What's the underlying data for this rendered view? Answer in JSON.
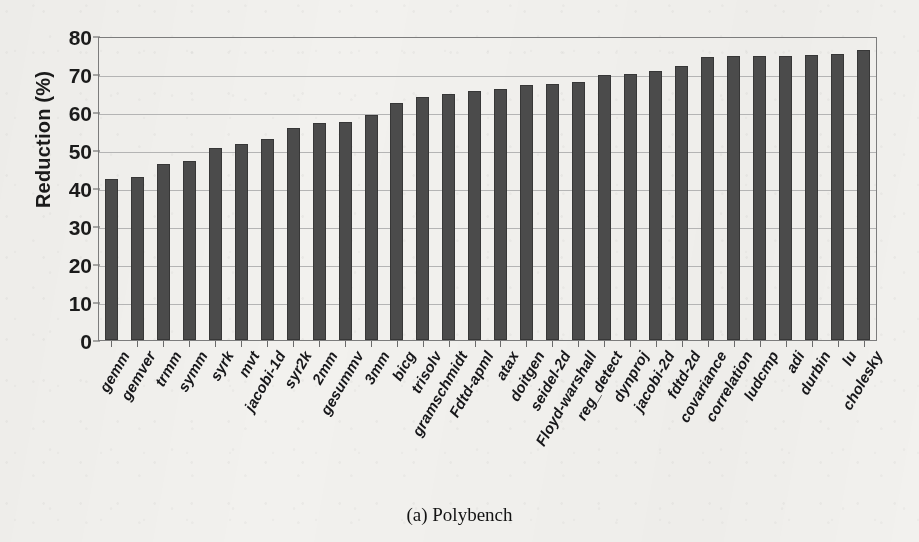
{
  "figure": {
    "caption": "(a) Polybench"
  },
  "chart_data": {
    "type": "bar",
    "title": "",
    "subtitle": "",
    "xlabel": "",
    "ylabel": "Reduction (%)",
    "ylim": [
      0,
      80
    ],
    "ytick_values": [
      0,
      10,
      20,
      30,
      40,
      50,
      60,
      70,
      80
    ],
    "ytick_labels": [
      "0",
      "10",
      "20",
      "30",
      "40",
      "50",
      "60",
      "70",
      "80"
    ],
    "grid": "horizontal",
    "legend": "none",
    "bar_color": "#4b4b4b",
    "background_color": "#f2f1ee",
    "categories": [
      "gemm",
      "gemver",
      "trmm",
      "symm",
      "syrk",
      "mvt",
      "jacobi-1d",
      "syr2k",
      "2mm",
      "gesummv",
      "3mm",
      "bicg",
      "trisolv",
      "gramschmidt",
      "Fdtd-apml",
      "atax",
      "doitgen",
      "seidel-2d",
      "Floyd-warshall",
      "reg_detect",
      "dynproj",
      "jacobi-2d",
      "fdtd-2d",
      "covariance",
      "correlation",
      "ludcmp",
      "adi",
      "durbin",
      "lu",
      "cholesky"
    ],
    "values": [
      42.3,
      42.8,
      46.3,
      47.0,
      50.4,
      51.5,
      52.8,
      55.9,
      57.0,
      57.5,
      59.1,
      62.4,
      63.9,
      64.7,
      65.4,
      66.1,
      67.0,
      67.4,
      67.8,
      69.8,
      69.9,
      70.8,
      72.0,
      74.5,
      74.8,
      74.7,
      74.8,
      74.9,
      75.2,
      76.3
    ]
  }
}
